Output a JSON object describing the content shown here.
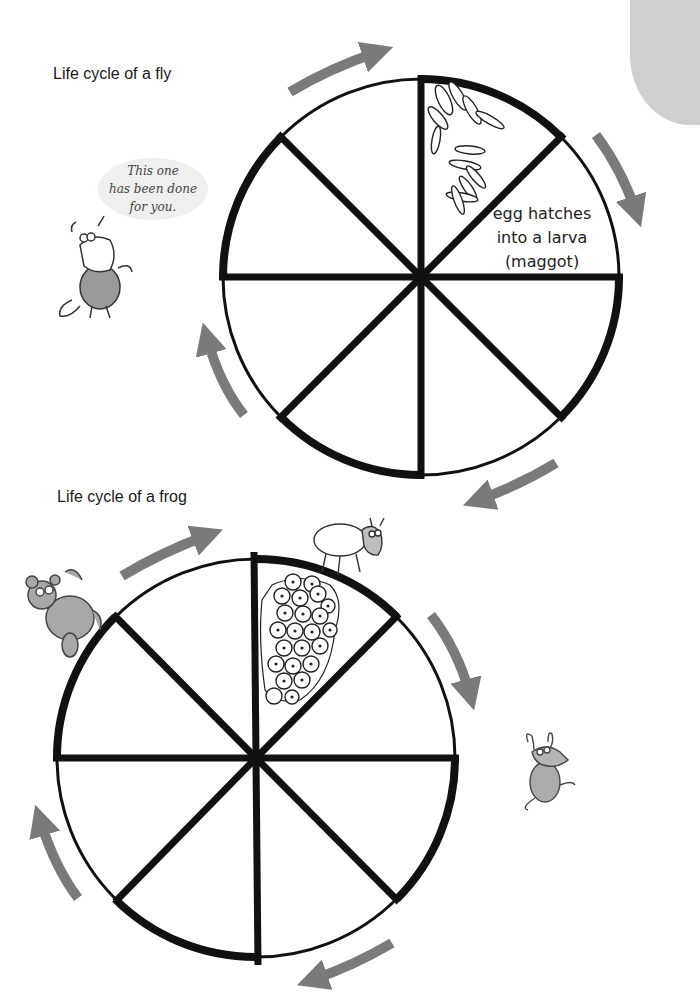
{
  "page": {
    "corner_color": "#cfcfcf",
    "arrow_color": "#7a7a7a",
    "line_color": "#111111"
  },
  "fly": {
    "title": "Life cycle of a fly",
    "speech_bubble": {
      "lines": [
        "This one",
        "has been done",
        "for you."
      ]
    },
    "segments": [
      {
        "position": 1,
        "content": "eggs-illustration",
        "label": ""
      },
      {
        "position": 2,
        "content": "text",
        "label": "egg hatches into a larva (maggot)",
        "lines": [
          "egg hatches",
          "into a larva",
          "(maggot)"
        ]
      },
      {
        "position": 3,
        "content": "empty",
        "label": ""
      },
      {
        "position": 4,
        "content": "empty",
        "label": ""
      },
      {
        "position": 5,
        "content": "empty",
        "label": ""
      },
      {
        "position": 6,
        "content": "empty",
        "label": ""
      },
      {
        "position": 7,
        "content": "empty",
        "label": ""
      },
      {
        "position": 8,
        "content": "empty",
        "label": ""
      }
    ],
    "character": "cow-icon"
  },
  "frog": {
    "title": "Life cycle of a frog",
    "segments": [
      {
        "position": 1,
        "content": "frogspawn-illustration",
        "label": ""
      },
      {
        "position": 2,
        "content": "empty",
        "label": ""
      },
      {
        "position": 3,
        "content": "empty",
        "label": ""
      },
      {
        "position": 4,
        "content": "empty",
        "label": ""
      },
      {
        "position": 5,
        "content": "empty",
        "label": ""
      },
      {
        "position": 6,
        "content": "empty",
        "label": ""
      },
      {
        "position": 7,
        "content": "empty",
        "label": ""
      },
      {
        "position": 8,
        "content": "empty",
        "label": ""
      }
    ],
    "characters": [
      "bear-icon",
      "sheep-icon",
      "rat-icon"
    ]
  }
}
